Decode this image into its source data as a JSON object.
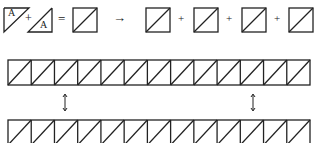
{
  "equation": {
    "piece_label_1": "A",
    "piece_label_2": "A",
    "plus_1": "+",
    "equals": "=",
    "arrow": "→",
    "plus_2": "+",
    "plus_3": "+",
    "plus_4": "+"
  },
  "strips": {
    "cell_count": 13,
    "top_strip": "half-square triangle row",
    "bottom_strip": "half-square triangle row"
  },
  "connectors": [
    "double-arrow-left",
    "double-arrow-right"
  ],
  "colors": {
    "line": "#222222",
    "background": "#ffffff"
  }
}
